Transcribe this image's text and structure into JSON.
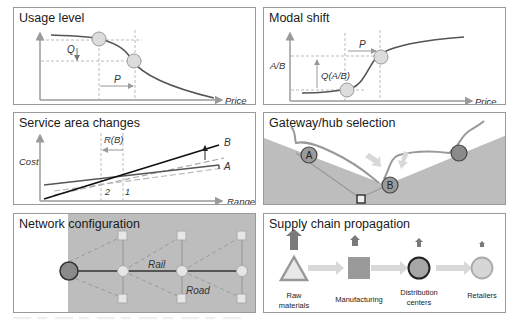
{
  "colors": {
    "curve": "#555555",
    "axis": "#9a9a9a",
    "guide": "#aaaaaa",
    "node_fill": "#dcdcdc",
    "node_dark": "#8a8a8a",
    "land": "#bdbdbd",
    "arrow_light": "#d8d8d8",
    "up_arrow": "#7a7a7a"
  },
  "panels": {
    "usage_level": {
      "title": "Usage level",
      "q_label": "Q",
      "p_label": "P",
      "x_axis_label": "Price"
    },
    "modal_shift": {
      "title": "Modal shift",
      "y_axis_label": "A/B",
      "q_label": "Q(A/B)",
      "p_label": "P",
      "x_axis_label": "Price"
    },
    "service_area": {
      "title": "Service area changes",
      "y_axis_label": "Cost",
      "r_label": "R(B)",
      "line_b_label": "B",
      "line_a_label": "A",
      "tick_2": "2",
      "tick_1": "1",
      "x_axis_label": "Range"
    },
    "gateway": {
      "title": "Gateway/hub selection",
      "node_a_label": "A",
      "node_b_label": "B"
    },
    "network": {
      "title": "Network configuration",
      "rail_label": "Rail",
      "road_label": "Road"
    },
    "supply_chain": {
      "title": "Supply chain propagation",
      "stages": [
        {
          "label_line1": "Raw",
          "label_line2": "materials"
        },
        {
          "label_line1": "Manufacturing",
          "label_line2": ""
        },
        {
          "label_line1": "Distribution",
          "label_line2": "centers"
        },
        {
          "label_line1": "Retailers",
          "label_line2": ""
        }
      ]
    }
  }
}
